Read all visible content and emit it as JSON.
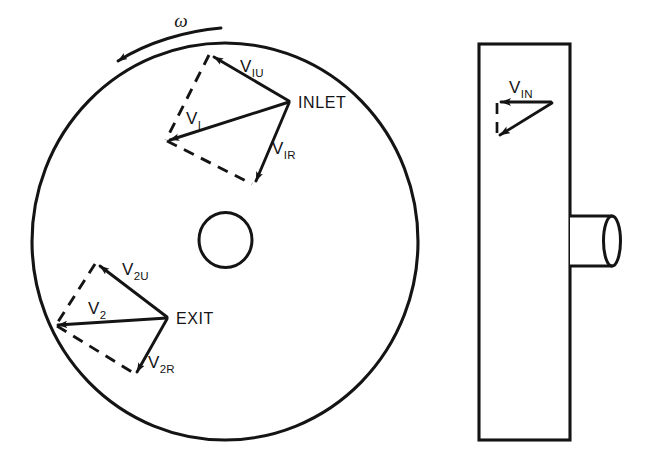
{
  "figure": {
    "background_color": "#ffffff",
    "line_color": "#141414"
  },
  "front_view": {
    "name": "impeller-front-view",
    "rotation": {
      "symbol": "ω",
      "direction": "counterclockwise"
    },
    "inlet": {
      "point_label": "INLET",
      "vectors": [
        {
          "key": "tangential",
          "label_v": "V",
          "label_sub": "IU"
        },
        {
          "key": "absolute",
          "label_v": "V",
          "label_sub": "I"
        },
        {
          "key": "relative",
          "label_v": "V",
          "label_sub": "IR"
        }
      ]
    },
    "exit": {
      "point_label": "EXIT",
      "vectors": [
        {
          "key": "tangential",
          "label_v": "V",
          "label_sub": "2U"
        },
        {
          "key": "absolute",
          "label_v": "V",
          "label_sub": "2"
        },
        {
          "key": "relative",
          "label_v": "V",
          "label_sub": "2R"
        }
      ]
    }
  },
  "side_view": {
    "name": "impeller-side-view",
    "inflow": {
      "label_v": "V",
      "label_sub": "IN"
    }
  }
}
